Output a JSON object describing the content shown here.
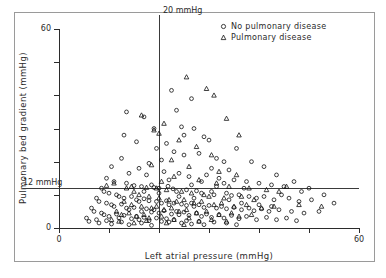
{
  "chart_data": {
    "type": "scatter",
    "title": "",
    "xlabel": "Left atrial pressure (mmHg)",
    "ylabel": "Pulmonary bed gradient (mmHg)",
    "xlim": [
      0,
      60
    ],
    "ylim": [
      0,
      60
    ],
    "xticks": [
      0,
      10,
      20,
      30,
      40,
      50,
      60
    ],
    "yticks": [
      0,
      10,
      20,
      30,
      40,
      50,
      60
    ],
    "xtick_labels": [
      "0",
      "",
      "",
      "",
      "",
      "",
      "60"
    ],
    "ytick_labels": [
      "0",
      "",
      "",
      "",
      "",
      "",
      "60"
    ],
    "grid": false,
    "legend_position": "top-right",
    "annotations": [
      {
        "name": "vertical-reference",
        "label": "20 mmHg",
        "axis": "x",
        "value": 20
      },
      {
        "name": "horizontal-reference",
        "label": "12 mmHg",
        "axis": "y",
        "value": 12
      }
    ],
    "series": [
      {
        "name": "No pulmonary disease",
        "marker": "circle",
        "points": [
          [
            22.5,
            41.5
          ],
          [
            26.5,
            39.0
          ],
          [
            17.0,
            33.5
          ],
          [
            24.5,
            30.5
          ],
          [
            27.0,
            30.0
          ],
          [
            29.0,
            27.5
          ],
          [
            30.0,
            26.5
          ],
          [
            21.5,
            25.5
          ],
          [
            19.5,
            24.0
          ],
          [
            23.0,
            23.0
          ],
          [
            25.0,
            22.0
          ],
          [
            13.0,
            28.0
          ],
          [
            15.5,
            26.0
          ],
          [
            28.0,
            22.5
          ],
          [
            31.5,
            21.0
          ],
          [
            33.0,
            20.0
          ],
          [
            20.5,
            20.5
          ],
          [
            18.0,
            19.5
          ],
          [
            16.0,
            18.0
          ],
          [
            12.5,
            21.0
          ],
          [
            10.5,
            18.5
          ],
          [
            14.0,
            16.5
          ],
          [
            17.5,
            16.0
          ],
          [
            21.0,
            17.0
          ],
          [
            24.0,
            16.5
          ],
          [
            26.0,
            15.5
          ],
          [
            29.5,
            16.0
          ],
          [
            32.0,
            15.0
          ],
          [
            35.0,
            14.5
          ],
          [
            37.5,
            14.0
          ],
          [
            40.0,
            13.5
          ],
          [
            42.5,
            13.0
          ],
          [
            45.0,
            12.5
          ],
          [
            9.5,
            15.0
          ],
          [
            11.0,
            14.0
          ],
          [
            13.5,
            13.5
          ],
          [
            15.0,
            12.8
          ],
          [
            16.5,
            12.5
          ],
          [
            18.5,
            13.0
          ],
          [
            19.0,
            12.2
          ],
          [
            20.0,
            12.0
          ],
          [
            21.8,
            12.6
          ],
          [
            22.8,
            11.8
          ],
          [
            23.5,
            11.0
          ],
          [
            25.5,
            11.5
          ],
          [
            27.5,
            11.2
          ],
          [
            28.5,
            10.5
          ],
          [
            30.5,
            11.0
          ],
          [
            31.0,
            10.0
          ],
          [
            33.5,
            10.5
          ],
          [
            34.5,
            9.8
          ],
          [
            36.0,
            10.0
          ],
          [
            38.0,
            9.5
          ],
          [
            39.5,
            9.0
          ],
          [
            41.0,
            9.5
          ],
          [
            43.0,
            8.5
          ],
          [
            46.0,
            9.0
          ],
          [
            48.0,
            8.0
          ],
          [
            50.5,
            8.5
          ],
          [
            8.5,
            12.0
          ],
          [
            9.0,
            11.0
          ],
          [
            10.0,
            10.5
          ],
          [
            11.5,
            10.0
          ],
          [
            12.0,
            9.5
          ],
          [
            13.0,
            9.0
          ],
          [
            14.5,
            9.5
          ],
          [
            15.5,
            8.5
          ],
          [
            16.0,
            8.0
          ],
          [
            17.0,
            8.8
          ],
          [
            18.0,
            8.2
          ],
          [
            19.5,
            8.0
          ],
          [
            20.5,
            7.5
          ],
          [
            21.5,
            8.2
          ],
          [
            22.0,
            7.0
          ],
          [
            23.0,
            7.5
          ],
          [
            24.5,
            7.2
          ],
          [
            25.5,
            6.8
          ],
          [
            26.5,
            7.5
          ],
          [
            27.0,
            6.5
          ],
          [
            28.0,
            7.0
          ],
          [
            29.0,
            6.2
          ],
          [
            30.0,
            6.8
          ],
          [
            31.5,
            6.0
          ],
          [
            32.5,
            6.5
          ],
          [
            33.5,
            5.8
          ],
          [
            35.0,
            6.2
          ],
          [
            36.5,
            5.5
          ],
          [
            38.0,
            6.0
          ],
          [
            39.0,
            5.2
          ],
          [
            40.5,
            5.8
          ],
          [
            42.0,
            5.0
          ],
          [
            44.0,
            5.5
          ],
          [
            46.5,
            5.0
          ],
          [
            49.0,
            4.5
          ],
          [
            52.0,
            5.0
          ],
          [
            7.5,
            9.0
          ],
          [
            8.0,
            8.0
          ],
          [
            9.5,
            7.5
          ],
          [
            10.5,
            7.0
          ],
          [
            11.0,
            6.5
          ],
          [
            12.5,
            7.2
          ],
          [
            13.5,
            6.0
          ],
          [
            14.0,
            5.5
          ],
          [
            15.0,
            6.2
          ],
          [
            16.5,
            5.0
          ],
          [
            17.5,
            5.8
          ],
          [
            18.5,
            4.8
          ],
          [
            19.0,
            5.5
          ],
          [
            20.0,
            4.5
          ],
          [
            21.0,
            5.2
          ],
          [
            22.5,
            4.2
          ],
          [
            23.5,
            5.0
          ],
          [
            24.0,
            4.0
          ],
          [
            25.0,
            4.8
          ],
          [
            26.0,
            3.8
          ],
          [
            27.5,
            4.5
          ],
          [
            28.5,
            3.5
          ],
          [
            29.5,
            4.2
          ],
          [
            30.5,
            3.2
          ],
          [
            32.0,
            4.0
          ],
          [
            33.0,
            3.0
          ],
          [
            34.5,
            3.8
          ],
          [
            36.0,
            2.8
          ],
          [
            37.5,
            3.5
          ],
          [
            39.5,
            2.5
          ],
          [
            41.5,
            3.2
          ],
          [
            43.5,
            2.5
          ],
          [
            45.5,
            3.0
          ],
          [
            47.5,
            2.2
          ],
          [
            6.5,
            6.0
          ],
          [
            7.0,
            5.0
          ],
          [
            8.5,
            4.5
          ],
          [
            9.0,
            4.0
          ],
          [
            10.0,
            3.5
          ],
          [
            11.5,
            4.2
          ],
          [
            12.0,
            3.0
          ],
          [
            13.0,
            3.8
          ],
          [
            14.5,
            2.8
          ],
          [
            15.5,
            3.5
          ],
          [
            16.0,
            2.5
          ],
          [
            17.0,
            3.2
          ],
          [
            18.0,
            2.2
          ],
          [
            19.5,
            3.0
          ],
          [
            20.5,
            2.0
          ],
          [
            21.5,
            2.8
          ],
          [
            22.0,
            1.8
          ],
          [
            23.0,
            2.5
          ],
          [
            24.5,
            1.5
          ],
          [
            25.5,
            2.2
          ],
          [
            26.5,
            1.2
          ],
          [
            28.0,
            2.0
          ],
          [
            29.0,
            1.0
          ],
          [
            31.0,
            1.8
          ],
          [
            33.5,
            1.5
          ],
          [
            35.5,
            1.0
          ],
          [
            5.5,
            3.0
          ],
          [
            6.0,
            2.0
          ],
          [
            7.5,
            2.5
          ],
          [
            8.0,
            1.5
          ],
          [
            9.5,
            2.2
          ],
          [
            10.5,
            1.2
          ],
          [
            12.5,
            1.8
          ],
          [
            14.0,
            1.0
          ],
          [
            16.5,
            1.5
          ],
          [
            18.5,
            0.8
          ],
          [
            13.5,
            35.0
          ],
          [
            19.0,
            30.0
          ],
          [
            23.5,
            35.5
          ],
          [
            25.0,
            28.0
          ],
          [
            35.5,
            24.0
          ],
          [
            38.5,
            20.0
          ],
          [
            30.5,
            18.0
          ],
          [
            34.0,
            17.5
          ],
          [
            41.0,
            18.5
          ],
          [
            43.5,
            16.0
          ],
          [
            47.0,
            14.0
          ],
          [
            50.0,
            12.0
          ],
          [
            53.0,
            10.0
          ],
          [
            55.0,
            7.5
          ],
          [
            48.5,
            11.0
          ],
          [
            44.5,
            10.0
          ],
          [
            37.0,
            12.0
          ],
          [
            33.0,
            13.5
          ],
          [
            26.5,
            13.0
          ],
          [
            22.0,
            14.5
          ],
          [
            28.5,
            14.0
          ],
          [
            31.5,
            12.5
          ],
          [
            24.0,
            9.5
          ],
          [
            20.0,
            10.5
          ],
          [
            17.0,
            11.0
          ],
          [
            27.0,
            9.0
          ],
          [
            34.0,
            8.5
          ],
          [
            36.5,
            7.5
          ],
          [
            40.0,
            7.0
          ],
          [
            42.5,
            6.5
          ]
        ]
      },
      {
        "name": "Pulmonary disease",
        "marker": "triangle",
        "points": [
          [
            25.5,
            45.5
          ],
          [
            29.5,
            42.0
          ],
          [
            31.0,
            40.0
          ],
          [
            16.5,
            34.0
          ],
          [
            21.0,
            31.5
          ],
          [
            19.0,
            29.5
          ],
          [
            20.0,
            28.5
          ],
          [
            24.0,
            26.5
          ],
          [
            33.5,
            33.0
          ],
          [
            36.0,
            28.0
          ],
          [
            27.5,
            24.5
          ],
          [
            30.5,
            22.0
          ],
          [
            22.5,
            20.5
          ],
          [
            18.5,
            19.0
          ],
          [
            26.0,
            18.5
          ],
          [
            32.0,
            17.0
          ],
          [
            35.5,
            16.0
          ],
          [
            23.0,
            15.5
          ],
          [
            20.5,
            14.0
          ],
          [
            28.0,
            14.5
          ],
          [
            31.5,
            13.5
          ],
          [
            34.0,
            12.5
          ],
          [
            38.0,
            12.0
          ],
          [
            41.5,
            11.5
          ],
          [
            44.0,
            11.0
          ],
          [
            17.5,
            12.2
          ],
          [
            19.5,
            12.0
          ],
          [
            21.5,
            11.5
          ],
          [
            24.5,
            11.0
          ],
          [
            26.5,
            10.5
          ],
          [
            29.0,
            10.0
          ],
          [
            30.0,
            9.5
          ],
          [
            33.0,
            9.0
          ],
          [
            36.5,
            9.5
          ],
          [
            39.0,
            8.5
          ],
          [
            15.0,
            11.0
          ],
          [
            16.0,
            10.0
          ],
          [
            18.0,
            9.5
          ],
          [
            20.0,
            9.0
          ],
          [
            22.0,
            8.5
          ],
          [
            23.5,
            8.0
          ],
          [
            25.0,
            8.5
          ],
          [
            27.0,
            7.5
          ],
          [
            28.5,
            8.0
          ],
          [
            31.0,
            7.0
          ],
          [
            32.5,
            7.5
          ],
          [
            35.0,
            6.5
          ],
          [
            37.5,
            7.0
          ],
          [
            40.5,
            6.0
          ],
          [
            43.0,
            6.5
          ],
          [
            13.0,
            8.0
          ],
          [
            14.5,
            7.0
          ],
          [
            16.5,
            6.5
          ],
          [
            18.5,
            6.0
          ],
          [
            19.5,
            6.5
          ],
          [
            21.0,
            5.5
          ],
          [
            22.5,
            6.0
          ],
          [
            24.0,
            5.0
          ],
          [
            25.5,
            5.5
          ],
          [
            27.5,
            4.5
          ],
          [
            29.5,
            5.0
          ],
          [
            32.0,
            4.0
          ],
          [
            34.5,
            4.5
          ],
          [
            36.0,
            3.5
          ],
          [
            38.5,
            4.0
          ],
          [
            11.5,
            5.0
          ],
          [
            12.5,
            4.0
          ],
          [
            14.0,
            4.5
          ],
          [
            15.5,
            3.5
          ],
          [
            17.0,
            4.0
          ],
          [
            18.0,
            3.0
          ],
          [
            20.5,
            3.5
          ],
          [
            23.0,
            2.5
          ],
          [
            26.0,
            3.0
          ],
          [
            28.0,
            2.0
          ],
          [
            30.5,
            2.5
          ],
          [
            33.5,
            2.0
          ],
          [
            10.5,
            2.5
          ],
          [
            12.0,
            2.0
          ],
          [
            15.0,
            1.5
          ],
          [
            17.5,
            2.2
          ],
          [
            21.5,
            1.5
          ],
          [
            25.0,
            1.0
          ],
          [
            45.5,
            12.5
          ],
          [
            48.0,
            7.0
          ],
          [
            52.5,
            6.5
          ],
          [
            13.5,
            12.0
          ],
          [
            11.0,
            13.5
          ],
          [
            9.5,
            12.8
          ],
          [
            14.5,
            12.5
          ]
        ]
      }
    ]
  },
  "legend": {
    "entries": [
      {
        "marker_icon": "circle-marker-icon",
        "label": "No pulmonary disease"
      },
      {
        "marker_icon": "triangle-marker-icon",
        "label": "Pulmonary disease"
      }
    ]
  },
  "colors": {
    "marker": "#111111",
    "axis": "#2b2b2b",
    "reference_line": "#3a3a3a",
    "frame": "#9a9a9a",
    "background": "#ffffff"
  }
}
